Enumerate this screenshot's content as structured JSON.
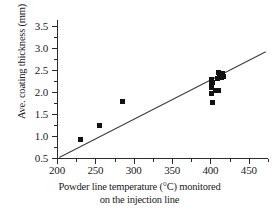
{
  "chart_data": {
    "type": "scatter",
    "title": "",
    "xlabel": "Powder line temperature (°C) monitored on the injection line",
    "xlabel_line1": "Powder line temperature (°C) monitored",
    "xlabel_line2": "on the injection line",
    "ylabel": "Ave. coating thickness (mm)",
    "xlim": [
      200,
      475
    ],
    "ylim": [
      0.4,
      3.7
    ],
    "xticks": [
      200,
      250,
      300,
      350,
      400,
      450
    ],
    "xtick_labels": [
      "200",
      "250",
      "300",
      "350",
      "400",
      "450"
    ],
    "xticks_minor": [
      225,
      275,
      325,
      375,
      425,
      475
    ],
    "yticks": [
      0.5,
      1.0,
      1.5,
      2.0,
      2.5,
      3.0,
      3.5
    ],
    "ytick_labels": [
      "0.5",
      "1.0",
      "1.5",
      "2.0",
      "2.5",
      "3.0",
      "3.5"
    ],
    "grid": false,
    "legend": "none",
    "marker": "square",
    "marker_color": "#121212",
    "series": [
      {
        "name": "Ave. coating thickness",
        "points": [
          [
            230,
            0.93
          ],
          [
            255,
            1.23
          ],
          [
            285,
            1.78
          ],
          [
            403,
            1.76
          ],
          [
            402,
            1.97
          ],
          [
            406,
            2.03
          ],
          [
            410,
            2.03
          ],
          [
            402,
            2.1
          ],
          [
            401,
            2.16
          ],
          [
            403,
            2.22
          ],
          [
            402,
            2.29
          ],
          [
            409,
            2.31
          ],
          [
            414,
            2.33
          ],
          [
            417,
            2.35
          ],
          [
            412,
            2.38
          ],
          [
            416,
            2.41
          ],
          [
            410,
            2.44
          ]
        ]
      }
    ],
    "trend_line": {
      "name": "linear fit",
      "x_start": 203,
      "y_start": 0.52,
      "x_end": 472,
      "y_end": 2.92,
      "color": "#3a3a3a"
    }
  }
}
